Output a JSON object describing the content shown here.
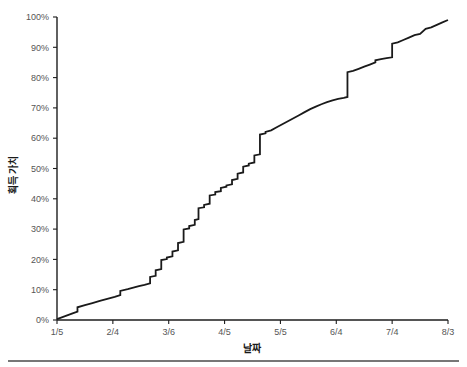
{
  "chart_data": {
    "type": "line",
    "title": "",
    "subtitle": "",
    "xlabel": "날짜",
    "ylabel": "획득 가치",
    "xlim": [
      "1/5",
      "8/3"
    ],
    "ylim": [
      0,
      100
    ],
    "grid": false,
    "legend": null,
    "y_tick_labels": [
      "0%",
      "10%",
      "20%",
      "30%",
      "40%",
      "50%",
      "60%",
      "70%",
      "80%",
      "90%",
      "100%"
    ],
    "y_tick_values": [
      0,
      10,
      20,
      30,
      40,
      50,
      60,
      70,
      80,
      90,
      100
    ],
    "x_tick_labels": [
      "1/5",
      "2/4",
      "3/6",
      "4/5",
      "5/5",
      "6/4",
      "7/4",
      "8/3"
    ],
    "x_tick_values": [
      0,
      30,
      60,
      90,
      120,
      150,
      180,
      210
    ],
    "series": [
      {
        "name": "획득 가치",
        "color": "#1a1a1a",
        "style": "step-like cumulative S-curve",
        "x": [
          0,
          4,
          8,
          11,
          11,
          15,
          19,
          23,
          27,
          31,
          34,
          34,
          38,
          41,
          44,
          47,
          50,
          50,
          53,
          53,
          56,
          56,
          59,
          59,
          62,
          62,
          65,
          65,
          68,
          68,
          71,
          71,
          74,
          74,
          76,
          76,
          79,
          79,
          82,
          82,
          85,
          85,
          88,
          88,
          91,
          91,
          94,
          94,
          97,
          97,
          100,
          100,
          103,
          103,
          106,
          106,
          109,
          109,
          112,
          112,
          115,
          118,
          121,
          124,
          127,
          130,
          133,
          136,
          139,
          142,
          145,
          148,
          151,
          154,
          156,
          156,
          159,
          162,
          165,
          168,
          171,
          171,
          174,
          177,
          180,
          180,
          183,
          186,
          189,
          192,
          195,
          198,
          201,
          204,
          207,
          210
        ],
        "y": [
          0.3,
          1.2,
          2.1,
          2.8,
          4.2,
          4.9,
          5.6,
          6.3,
          7.0,
          7.6,
          8.2,
          9.6,
          10.2,
          10.7,
          11.2,
          11.6,
          12.1,
          14.2,
          14.6,
          16.4,
          16.8,
          19.8,
          20.1,
          20.6,
          21.0,
          22.6,
          23.0,
          25.4,
          25.8,
          29.9,
          30.2,
          31.0,
          31.4,
          33.0,
          33.3,
          36.9,
          37.2,
          38.0,
          38.4,
          41.1,
          41.4,
          42.2,
          42.5,
          43.6,
          44.0,
          44.4,
          44.8,
          46.2,
          46.6,
          48.3,
          48.7,
          50.6,
          51.0,
          51.6,
          52.0,
          54.3,
          54.7,
          61.2,
          61.6,
          62.1,
          62.6,
          63.6,
          64.6,
          65.6,
          66.6,
          67.6,
          68.6,
          69.6,
          70.4,
          71.2,
          71.9,
          72.5,
          73.0,
          73.3,
          73.6,
          81.8,
          82.2,
          82.9,
          83.6,
          84.3,
          85.0,
          85.7,
          86.1,
          86.4,
          86.7,
          91.2,
          91.6,
          92.4,
          93.2,
          94.0,
          94.4,
          96.1,
          96.6,
          97.4,
          98.2,
          99.0
        ]
      }
    ],
    "annotations": []
  },
  "figure": {
    "background_color": "#ffffff",
    "line_color": "#1a1a1a",
    "axis_color": "#1d1d1d",
    "tick_text_color": "#555555",
    "title_text_color": "#1a1a1a"
  },
  "footer": {
    "rule_color": "#4a4a4a"
  }
}
